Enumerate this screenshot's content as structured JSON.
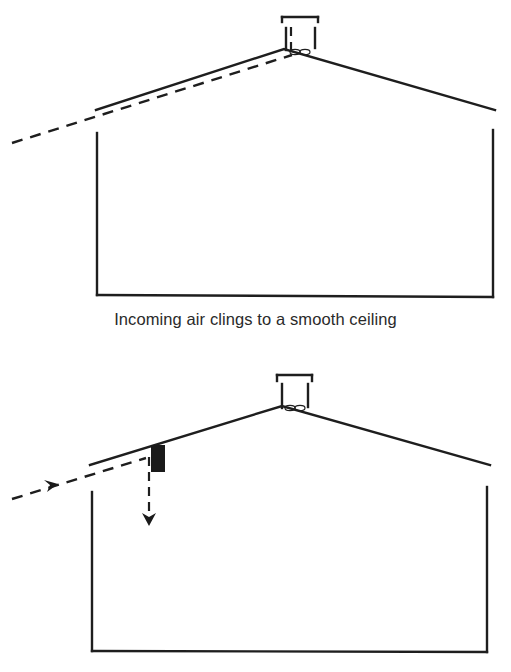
{
  "diagrams": [
    {
      "id": "smooth-ceiling",
      "caption": "Incoming air clings to a smooth ceiling",
      "elements": [
        "gable roof building",
        "roof ridge vent with exhaust fan",
        "dashed incoming air path along ceiling"
      ]
    },
    {
      "id": "baffled-ceiling",
      "caption": "",
      "elements": [
        "gable roof building",
        "roof ridge vent with exhaust fan",
        "dashed incoming air path with arrow",
        "black baffle under ceiling",
        "downward deflected air arrow"
      ]
    }
  ],
  "colors": {
    "line": "#1e1e1e",
    "baffle": "#1a1a1a",
    "background": "#ffffff"
  }
}
